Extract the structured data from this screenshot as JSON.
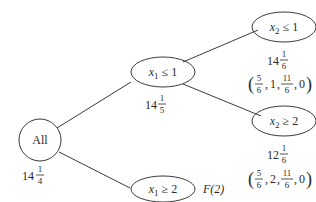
{
  "diagram": {
    "type": "branch-and-bound tree",
    "nodes": [
      {
        "id": "root",
        "label": "All",
        "bound_whole": "14",
        "bound_num": "1",
        "bound_den": "4"
      },
      {
        "id": "x1le1",
        "var": "x",
        "sub": "1",
        "op": "≤",
        "val": "1",
        "bound_whole": "14",
        "bound_num": "1",
        "bound_den": "5"
      },
      {
        "id": "x1ge2",
        "var": "x",
        "sub": "1",
        "op": "≥",
        "val": "2",
        "note": "F(2)"
      },
      {
        "id": "x2le1",
        "var": "x",
        "sub": "2",
        "op": "≤",
        "val": "1",
        "bound_whole": "14",
        "bound_num": "1",
        "bound_den": "6",
        "solution": {
          "a_num": "5",
          "a_den": "6",
          "b": "1",
          "c_num": "11",
          "c_den": "6",
          "d": "0"
        }
      },
      {
        "id": "x2ge2",
        "var": "x",
        "sub": "2",
        "op": "≥",
        "val": "2",
        "bound_whole": "12",
        "bound_num": "1",
        "bound_den": "6",
        "solution": {
          "a_num": "5",
          "a_den": "6",
          "b": "2",
          "c_num": "11",
          "c_den": "6",
          "d": "0"
        }
      }
    ],
    "edges": [
      {
        "from": "root",
        "to": "x1le1"
      },
      {
        "from": "root",
        "to": "x1ge2"
      },
      {
        "from": "x1le1",
        "to": "x2le1"
      },
      {
        "from": "x1le1",
        "to": "x2ge2"
      }
    ]
  }
}
